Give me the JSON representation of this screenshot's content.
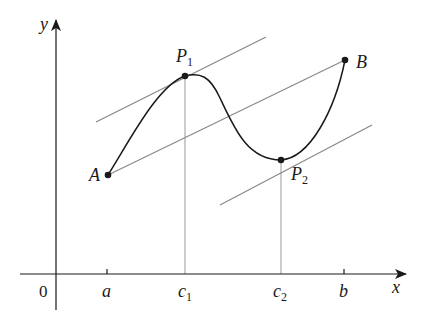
{
  "figure": {
    "axes": {
      "x_label": "x",
      "y_label": "y",
      "origin_label": "0"
    },
    "x_ticks": [
      {
        "label": "a",
        "sub": ""
      },
      {
        "label": "c",
        "sub": "1"
      },
      {
        "label": "c",
        "sub": "2"
      },
      {
        "label": "b",
        "sub": ""
      }
    ],
    "points": {
      "A": {
        "label": "A",
        "sub": ""
      },
      "B": {
        "label": "B",
        "sub": ""
      },
      "P1": {
        "label": "P",
        "sub": "1"
      },
      "P2": {
        "label": "P",
        "sub": "2"
      }
    },
    "colors": {
      "curve": "#1a1a1a",
      "axis": "#1a1a1a",
      "tangent_lines": "#8a8a8a",
      "drop_lines": "#9a9a9a"
    }
  }
}
